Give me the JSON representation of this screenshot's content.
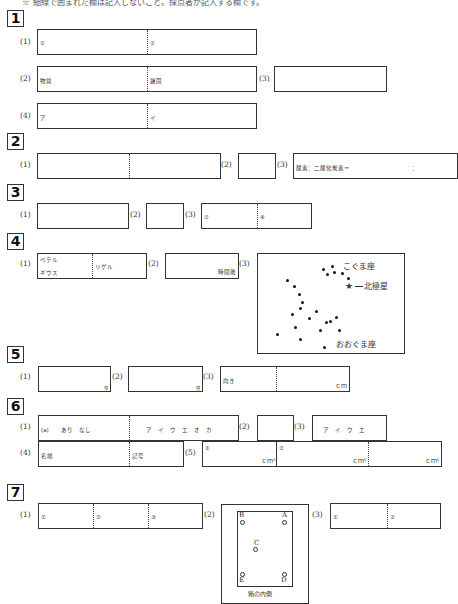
{
  "header_note": "※ 細線で囲まれた欄は記入しないこと。採点者が記入する欄です。",
  "sections": [
    {
      "id": "1",
      "questions": [
        {
          "label": "(1)",
          "cells": [
            "①",
            "②"
          ]
        },
        {
          "label": "(2)",
          "cells": [
            "物質",
            "鎌固"
          ]
        },
        {
          "label": "(3)",
          "cells": [
            ""
          ]
        },
        {
          "label": "(4)",
          "cells": [
            "ア",
            "イ"
          ]
        }
      ]
    },
    {
      "id": "2",
      "questions": [
        {
          "label": "(1)",
          "cells": [
            "",
            ""
          ]
        },
        {
          "label": "(2)",
          "cells": [
            ""
          ]
        },
        {
          "label": "(3)",
          "cells": [
            "酸素：二酸化炭素＝",
            "："
          ]
        }
      ]
    },
    {
      "id": "3",
      "questions": [
        {
          "label": "(1)",
          "cells": [
            ""
          ]
        },
        {
          "label": "(2)",
          "cells": [
            ""
          ]
        },
        {
          "label": "(3)",
          "cells": [
            "②",
            "④"
          ]
        }
      ]
    },
    {
      "id": "4",
      "questions": [
        {
          "label": "(1)",
          "cells": [
            "ベテル",
            "ギウス",
            "リゲル"
          ]
        },
        {
          "label": "(2)",
          "cells": [
            "時間後"
          ]
        },
        {
          "label": "(3)",
          "map": {
            "little_dipper": "こぐま座",
            "polaris": "北極星",
            "big_dipper": "おおぐま座"
          }
        }
      ]
    },
    {
      "id": "5",
      "questions": [
        {
          "label": "(1)",
          "unit": "g"
        },
        {
          "label": "(2)",
          "unit": "g"
        },
        {
          "label": "(3)",
          "cells": [
            "向き"
          ],
          "unit": "ｃｍ"
        }
      ]
    },
    {
      "id": "6",
      "questions": [
        {
          "label": "(1)",
          "cells": [
            "(a)　　あり　なし",
            "ア　イ　ウ　エ　オ　カ"
          ]
        },
        {
          "label": "(2)",
          "cells": [
            ""
          ]
        },
        {
          "label": "(3)",
          "cells": [
            "ア　イ　ウ　エ"
          ]
        },
        {
          "label": "(4)",
          "cells": [
            "名前",
            "記号"
          ]
        },
        {
          "label": "(5)",
          "cells": [
            "①",
            "②",
            ""
          ],
          "unit": "ｃｍ³"
        }
      ]
    },
    {
      "id": "7",
      "questions": [
        {
          "label": "(1)",
          "cells": [
            "①",
            "②",
            "③"
          ]
        },
        {
          "label": "(2)",
          "figure": {
            "points": [
              "A",
              "B",
              "C",
              "D",
              "E"
            ],
            "caption": "箱の内側"
          }
        },
        {
          "label": "(3)",
          "cells": [
            "①",
            "②"
          ]
        }
      ]
    }
  ]
}
